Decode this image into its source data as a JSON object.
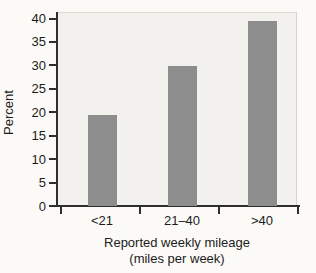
{
  "chart_data": {
    "type": "bar",
    "categories": [
      "<21",
      "21–40",
      ">40"
    ],
    "values": [
      19.4,
      29.9,
      39.4
    ],
    "title": "",
    "xlabel": "Reported weekly mileage",
    "xlabel_line2": "(miles per week)",
    "ylabel": "Percent",
    "ylim": [
      0,
      40
    ],
    "yticks": [
      0,
      5,
      10,
      15,
      20,
      25,
      30,
      35,
      40
    ],
    "legend": "none",
    "grid": false,
    "bar_color": "#8d8d8d",
    "axis_color": "#2e2e2e",
    "text_color": "#1c1c1c",
    "plot_background": "#f3f1ed",
    "page_background": "#fbfaf7"
  }
}
